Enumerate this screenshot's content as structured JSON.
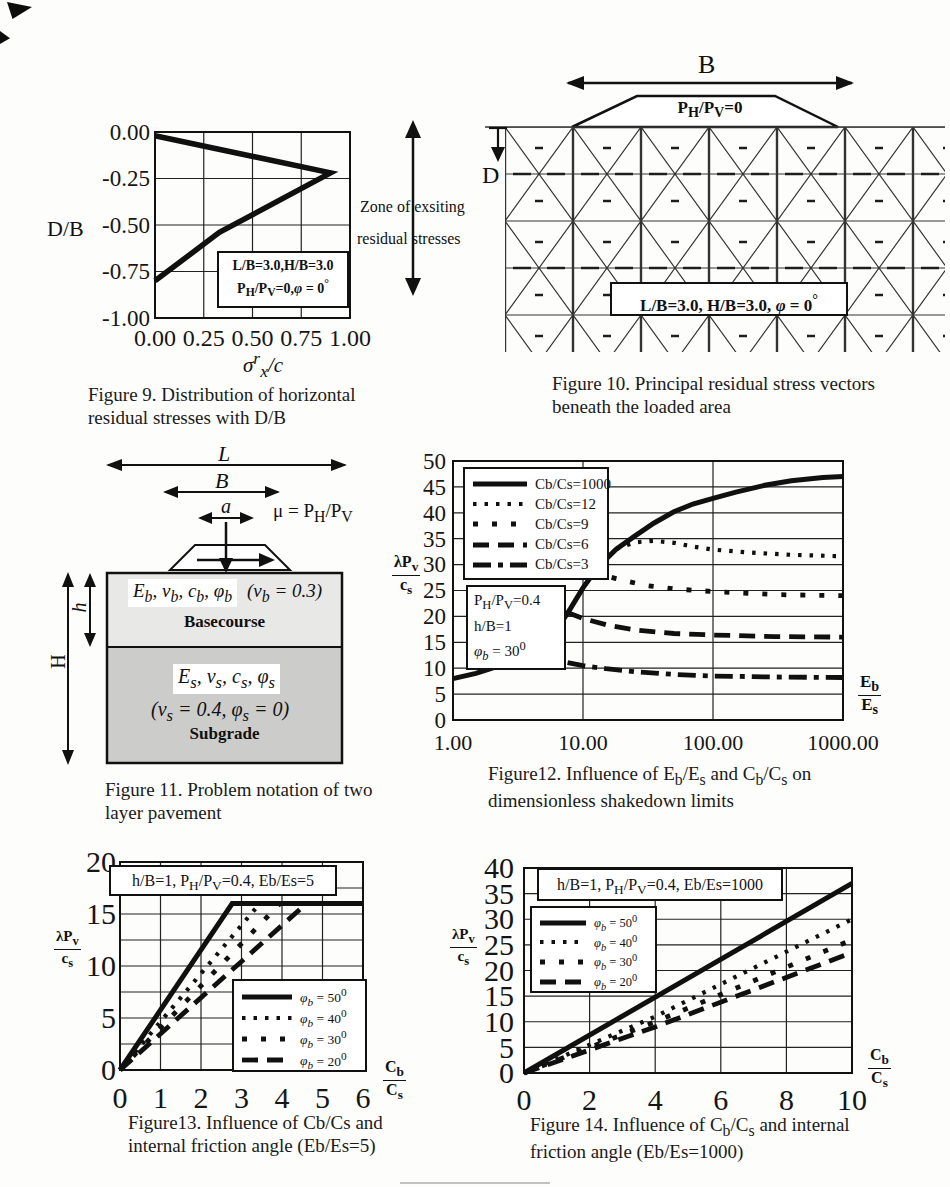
{
  "zone_note": {
    "line1": "Zone of exsiting",
    "line2": "residual stresses"
  },
  "fig9": {
    "ylabel": "D/B",
    "xlabel_html": "σ<sup>r</sup><sub>x</sub>/c",
    "annotation_html": "L/B=3.0,H/B=3.0<br>P<sub>H</sub>/P<sub>V</sub>=0,<i>φ</i> = 0<sup>°</sup>",
    "caption": "Figure 9. Distribution of horizontal residual stresses with D/B"
  },
  "fig10": {
    "b_label": "B",
    "d_label": "D",
    "load_label_html": "P<sub>H</sub>/P<sub>V</sub>=0",
    "annotation_html": "L/B=3.0, H/B=3.0, <i>φ</i> = 0<sup>°</sup>",
    "caption": "Figure 10. Principal residual stress vectors beneath the loaded area"
  },
  "fig11": {
    "l_label": "L",
    "b_label": "B",
    "a_label": "a",
    "mu_html": "μ = P<sub>H</sub>/P<sub>V</sub>",
    "h_layer_label": "h",
    "h_total_label": "H",
    "base_params_html": "E<sub>b</sub>, ν<sub>b</sub>, c<sub>b</sub>, φ<sub>b</sub>",
    "base_poisson_html": "(ν<sub>b</sub> = 0.3)",
    "base_name": "Basecourse",
    "sub_params_html": "E<sub>s</sub>, ν<sub>s</sub>, c<sub>s</sub>, φ<sub>s</sub>",
    "sub_poisson_html": "(ν<sub>s</sub> = 0.4, φ<sub>s</sub> = 0)",
    "sub_name": "Subgrade",
    "caption": "Figure 11. Problem notation of two layer pavement"
  },
  "fig12": {
    "ylabel_num_html": "λP<sub>v</sub>",
    "ylabel_den_html": "c<sub>s</sub>",
    "xlabel_num_html": "E<sub>b</sub>",
    "xlabel_den_html": "E<sub>s</sub>",
    "annotation_html": "P<sub>H</sub>/P<sub>V</sub>=0.4<br>h/B=1<br><i>φ<sub>b</sub></i> = 30<sup>0</sup>",
    "caption_html": "Figure12. Influence of E<sub>b</sub>/E<sub>s</sub> and C<sub>b</sub>/C<sub>s</sub> on dimensionless shakedown limits"
  },
  "fig13": {
    "ylabel_num_html": "λP<sub>v</sub>",
    "ylabel_den_html": "c<sub>s</sub>",
    "xlabel_num_html": "C<sub>b</sub>",
    "xlabel_den_html": "C<sub>s</sub>",
    "annotation_html": "h/B=1, P<sub>H</sub>/P<sub>V</sub>=0.4, Eb/Es=5",
    "caption": "Figure13. Influence of  Cb/Cs and internal friction angle (Eb/Es=5)"
  },
  "fig14": {
    "ylabel_num_html": "λP<sub>v</sub>",
    "ylabel_den_html": "c<sub>s</sub>",
    "xlabel_num_html": "C<sub>b</sub>",
    "xlabel_den_html": "C<sub>s</sub>",
    "annotation_html": "h/B=1, P<sub>H</sub>/P<sub>V</sub>=0.4, Eb/Es=1000",
    "caption_html": "Figure 14. Influence of  C<sub>b</sub>/C<sub>s</sub> and internal friction angle (Eb/Es=1000)"
  },
  "chart_data": [
    {
      "id": "fig9",
      "type": "line",
      "title": "Figure 9. Distribution of horizontal residual stresses with D/B",
      "xlabel": "sigma_x_r/c",
      "ylabel": "D/B",
      "x_scale": "linear",
      "x_range": [
        0,
        1
      ],
      "y_range": [
        -1,
        0
      ],
      "x_ticks": [
        "0.00",
        "0.25",
        "0.50",
        "0.75",
        "1.00"
      ],
      "y_ticks": [
        "0.00",
        "-0.25",
        "-0.50",
        "-0.75",
        "-1.00"
      ],
      "grid": true,
      "legend_position": "none",
      "series": [
        {
          "name": "horizontal residual stress profile",
          "style": "thick",
          "points": [
            [
              0.0,
              -0.02
            ],
            [
              0.9,
              -0.22
            ],
            [
              0.33,
              -0.54
            ],
            [
              0.0,
              -0.8
            ]
          ]
        }
      ]
    },
    {
      "id": "fig12",
      "type": "line",
      "title": "Figure12. Influence of Eb/Es and Cb/Cs on dimensionless shakedown limits",
      "xlabel": "Eb/Es",
      "ylabel": "lambda Pv / cs",
      "x_scale": "log",
      "x_range": [
        1,
        1000
      ],
      "y_range": [
        0,
        50
      ],
      "x_ticks": [
        "1.00",
        "10.00",
        "100.00",
        "1000.00"
      ],
      "y_ticks": [
        "0",
        "5",
        "10",
        "15",
        "20",
        "25",
        "30",
        "35",
        "40",
        "45",
        "50"
      ],
      "grid": true,
      "legend_position": "top-left",
      "annotation": "PH/PV=0.4, h/B=1, phi_b=30deg",
      "series": [
        {
          "name": "Cb/Cs=1000",
          "style": "solid",
          "points": [
            [
              1,
              8
            ],
            [
              1.5,
              9
            ],
            [
              2,
              10
            ],
            [
              3,
              12
            ],
            [
              4,
              13.3
            ],
            [
              5,
              15
            ],
            [
              6.5,
              18
            ],
            [
              8,
              21.5
            ],
            [
              10,
              25.5
            ],
            [
              13,
              29.5
            ],
            [
              18,
              33
            ],
            [
              25,
              35.5
            ],
            [
              35,
              38
            ],
            [
              50,
              40.2
            ],
            [
              70,
              41.7
            ],
            [
              100,
              42.8
            ],
            [
              150,
              44
            ],
            [
              250,
              45.3
            ],
            [
              400,
              46.2
            ],
            [
              700,
              46.8
            ],
            [
              1000,
              47
            ]
          ]
        },
        {
          "name": "Cb/Cs=12",
          "style": "dotted",
          "points": [
            [
              18,
              33
            ],
            [
              25,
              34.3
            ],
            [
              35,
              34.6
            ],
            [
              50,
              34.2
            ],
            [
              70,
              33.5
            ],
            [
              100,
              32.9
            ],
            [
              200,
              32.3
            ],
            [
              400,
              31.9
            ],
            [
              1000,
              31.6
            ]
          ]
        },
        {
          "name": "Cb/Cs=9",
          "style": "dotted2",
          "points": [
            [
              12,
              28.5
            ],
            [
              18,
              27.3
            ],
            [
              30,
              26
            ],
            [
              50,
              25.3
            ],
            [
              100,
              24.8
            ],
            [
              300,
              24.2
            ],
            [
              1000,
              24
            ]
          ]
        },
        {
          "name": "Cb/Cs=6",
          "style": "dashed",
          "points": [
            [
              7.5,
              20.8
            ],
            [
              10,
              19.6
            ],
            [
              15,
              18.4
            ],
            [
              25,
              17.4
            ],
            [
              50,
              16.7
            ],
            [
              100,
              16.4
            ],
            [
              300,
              16.1
            ],
            [
              1000,
              16
            ]
          ]
        },
        {
          "name": "Cb/Cs=3",
          "style": "dashdot",
          "points": [
            [
              4,
              12.5
            ],
            [
              6,
              11.6
            ],
            [
              10,
              10.5
            ],
            [
              15,
              9.9
            ],
            [
              25,
              9.3
            ],
            [
              50,
              8.8
            ],
            [
              100,
              8.5
            ],
            [
              300,
              8.3
            ],
            [
              1000,
              8.2
            ]
          ]
        }
      ]
    },
    {
      "id": "fig13",
      "type": "line",
      "title": "Figure13. Influence of Cb/Cs and internal friction angle (Eb/Es=5)",
      "xlabel": "Cb/Cs",
      "ylabel": "lambda Pv / cs",
      "x_scale": "linear",
      "x_range": [
        0,
        6
      ],
      "y_range": [
        0,
        20
      ],
      "x_ticks": [
        "0",
        "1",
        "2",
        "3",
        "4",
        "5",
        "6"
      ],
      "y_ticks": [
        "0",
        "5",
        "10",
        "15",
        "20"
      ],
      "y_gridlines": [
        0,
        2.5,
        5,
        7.5,
        10,
        12.5,
        15,
        17.5,
        20
      ],
      "grid": true,
      "legend_position": "bottom-right",
      "annotation": "h/B=1, PH/PV=0.4, Eb/Es=5",
      "series": [
        {
          "name": "phi_b = 50 deg",
          "style": "solid",
          "label_html": "<i>φ<sub>b</sub></i> = 50<sup>0</sup>",
          "points": [
            [
              0,
              0
            ],
            [
              2.77,
              16
            ],
            [
              6,
              16
            ]
          ]
        },
        {
          "name": "phi_b = 40 deg",
          "style": "dotted",
          "label_html": "<i>φ<sub>b</sub></i> = 40<sup>0</sup>",
          "points": [
            [
              0,
              0
            ],
            [
              3.45,
              16
            ],
            [
              6,
              16
            ]
          ]
        },
        {
          "name": "phi_b = 30 deg",
          "style": "dotted2",
          "label_html": "<i>φ<sub>b</sub></i> = 30<sup>0</sup>",
          "points": [
            [
              0,
              0
            ],
            [
              3.95,
              16
            ],
            [
              6,
              16
            ]
          ]
        },
        {
          "name": "phi_b = 20 deg",
          "style": "dashed",
          "label_html": "<i>φ<sub>b</sub></i> = 20<sup>0</sup>",
          "points": [
            [
              0,
              0
            ],
            [
              4.6,
              16
            ],
            [
              6,
              16
            ]
          ]
        }
      ]
    },
    {
      "id": "fig14",
      "type": "line",
      "title": "Figure 14. Influence of Cb/Cs and internal friction angle (Eb/Es=1000)",
      "xlabel": "Cb/Cs",
      "ylabel": "lambda Pv / cs",
      "x_scale": "linear",
      "x_range": [
        0,
        10
      ],
      "y_range": [
        0,
        40
      ],
      "x_ticks": [
        "0",
        "2",
        "4",
        "6",
        "8",
        "10"
      ],
      "y_ticks": [
        "0",
        "5",
        "10",
        "15",
        "20",
        "25",
        "30",
        "35",
        "40"
      ],
      "grid": true,
      "legend_position": "left",
      "annotation": "h/B=1, PH/PV=0.4, Eb/Es=1000",
      "series": [
        {
          "name": "phi_b = 50 deg",
          "style": "solid",
          "label_html": "<i>φ<sub>b</sub></i> = 50<sup>0</sup>",
          "points": [
            [
              0,
              0
            ],
            [
              10,
              37
            ]
          ]
        },
        {
          "name": "phi_b = 40 deg",
          "style": "dotted",
          "label_html": "<i>φ<sub>b</sub></i> = 40<sup>0</sup>",
          "points": [
            [
              0,
              0
            ],
            [
              4,
              11
            ],
            [
              10,
              30
            ]
          ]
        },
        {
          "name": "phi_b = 30 deg",
          "style": "dotted2",
          "label_html": "<i>φ<sub>b</sub></i> = 30<sup>0</sup>",
          "points": [
            [
              0,
              0
            ],
            [
              4,
              10
            ],
            [
              10,
              26
            ]
          ]
        },
        {
          "name": "phi_b = 20 deg",
          "style": "dashed",
          "label_html": "<i>φ<sub>b</sub></i> = 20<sup>0</sup>",
          "points": [
            [
              0,
              0
            ],
            [
              4,
              9
            ],
            [
              10,
              23.5
            ]
          ]
        }
      ]
    }
  ]
}
